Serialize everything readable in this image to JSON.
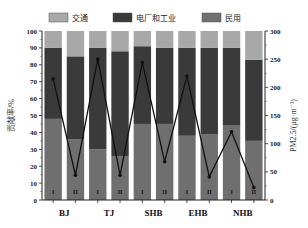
{
  "chart_data": {
    "type": "bar",
    "subtype": "stacked-bar-with-line",
    "title": "",
    "groups": [
      "BJ",
      "TJ",
      "SHB",
      "EHB",
      "NHB"
    ],
    "categories": [
      "BJ-I",
      "BJ-II",
      "TJ-I",
      "TJ-II",
      "SHB-I",
      "SHB-II",
      "EHB-I",
      "EHB-II",
      "NHB-I",
      "NHB-II"
    ],
    "bar_labels": [
      "I",
      "II",
      "I",
      "II",
      "I",
      "II",
      "I",
      "II",
      "I",
      "II"
    ],
    "series": [
      {
        "name": "民用",
        "color": "#6f6f6f",
        "values": [
          48,
          36,
          30,
          26,
          45,
          45,
          38,
          39,
          44,
          35
        ]
      },
      {
        "name": "电厂和工业",
        "color": "#3a3a3a",
        "values": [
          42,
          49,
          60,
          62,
          46,
          45,
          52,
          51,
          46,
          48
        ]
      },
      {
        "name": "交通",
        "color": "#a8a8a8",
        "values": [
          10,
          15,
          10,
          12,
          9,
          10,
          10,
          10,
          10,
          17
        ]
      }
    ],
    "line_series": {
      "name": "PM2.5",
      "axis": "right",
      "color": "#111111",
      "values": [
        215,
        44,
        250,
        44,
        244,
        68,
        220,
        41,
        121,
        22
      ]
    },
    "legend": [
      "交通",
      "电厂和工业",
      "民用"
    ],
    "legend_position": "top",
    "ylabel": "贡献率/%",
    "ylabel_right": "PM2.5/(μg·m⁻³)",
    "ylim": [
      0,
      100
    ],
    "ylim_right": [
      0,
      300
    ],
    "yticks": [
      0,
      10,
      20,
      30,
      40,
      50,
      60,
      70,
      80,
      90,
      100
    ],
    "yticks_right": [
      0,
      50,
      100,
      150,
      200,
      250,
      300
    ],
    "grid": false
  }
}
